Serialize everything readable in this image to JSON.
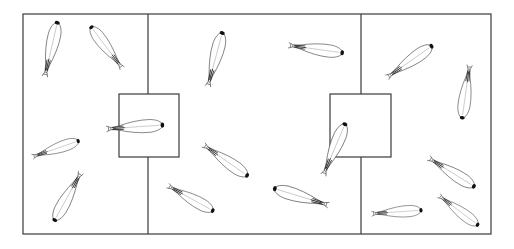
{
  "diagram": {
    "type": "arena-layout",
    "colors": {
      "line": "#3a3a3a",
      "background": "#ffffff",
      "head": "#111111"
    },
    "frame": {
      "x": 23,
      "y": 14,
      "width": 468,
      "height": 220
    },
    "dividers": [
      {
        "name": "left-divider",
        "x": 148,
        "y1": 14,
        "y2": 234
      },
      {
        "name": "right-divider",
        "x": 361,
        "y1": 14,
        "y2": 234
      }
    ],
    "chambers": [
      {
        "name": "left-center-chamber",
        "x": 119,
        "y": 94,
        "width": 60,
        "height": 63
      },
      {
        "name": "right-center-chamber",
        "x": 330,
        "y": 94,
        "width": 61,
        "height": 63
      }
    ],
    "larvae": [
      {
        "id": 1,
        "cx": 51,
        "cy": 50,
        "length": 57,
        "angle": -77
      },
      {
        "id": 2,
        "cx": 107,
        "cy": 48,
        "length": 53,
        "angle": -127
      },
      {
        "id": 3,
        "cx": 215,
        "cy": 60,
        "length": 57,
        "angle": -75
      },
      {
        "id": 4,
        "cx": 315,
        "cy": 49,
        "length": 56,
        "angle": 8
      },
      {
        "id": 5,
        "cx": 409,
        "cy": 62,
        "length": 56,
        "angle": -35
      },
      {
        "id": 6,
        "cx": 466,
        "cy": 91,
        "length": 55,
        "angle": 98
      },
      {
        "id": 7,
        "cx": 55,
        "cy": 149,
        "length": 50,
        "angle": -19
      },
      {
        "id": 8,
        "cx": 68,
        "cy": 196,
        "length": 56,
        "angle": 119
      },
      {
        "id": 9,
        "cx": 134,
        "cy": 127,
        "length": 58,
        "angle": -4
      },
      {
        "id": 10,
        "cx": 225,
        "cy": 160,
        "length": 55,
        "angle": 35
      },
      {
        "id": 11,
        "cx": 190,
        "cy": 198,
        "length": 53,
        "angle": 29
      },
      {
        "id": 12,
        "cx": 334,
        "cy": 150,
        "length": 57,
        "angle": -67
      },
      {
        "id": 13,
        "cx": 302,
        "cy": 197,
        "length": 58,
        "angle": -163
      },
      {
        "id": 14,
        "cx": 451,
        "cy": 172,
        "length": 55,
        "angle": 32
      },
      {
        "id": 15,
        "cx": 396,
        "cy": 212,
        "length": 51,
        "angle": -4
      },
      {
        "id": 16,
        "cx": 458,
        "cy": 210,
        "length": 50,
        "angle": 37
      }
    ]
  }
}
